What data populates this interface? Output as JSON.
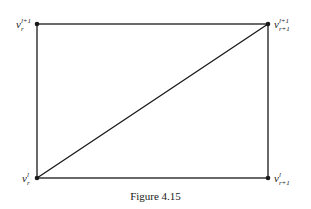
{
  "figure": {
    "caption": "Figure 4.15",
    "vertices": [
      {
        "id": "top-left",
        "base": "v",
        "sup": "l+1",
        "sub": "r",
        "x": 37,
        "y": 24
      },
      {
        "id": "top-right",
        "base": "v",
        "sup": "l+1",
        "sub": "r+1",
        "x": 268,
        "y": 24
      },
      {
        "id": "bottom-left",
        "base": "v",
        "sup": "l",
        "sub": "r",
        "x": 37,
        "y": 178
      },
      {
        "id": "bottom-right",
        "base": "v",
        "sup": "l",
        "sub": "r+1",
        "x": 268,
        "y": 178
      }
    ],
    "edges": [
      [
        "top-left",
        "top-right"
      ],
      [
        "top-right",
        "bottom-right"
      ],
      [
        "bottom-right",
        "bottom-left"
      ],
      [
        "bottom-left",
        "top-left"
      ],
      [
        "bottom-left",
        "top-right"
      ]
    ],
    "colors": {
      "stroke": "#1a1a1a",
      "background": "#ffffff"
    }
  }
}
